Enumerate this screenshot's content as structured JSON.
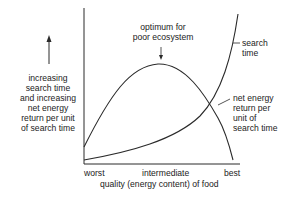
{
  "diagram": {
    "y_axis_label": [
      "increasing",
      "search time",
      "and increasing",
      "net energy",
      "return per unit",
      "of search time"
    ],
    "x_axis_label": "quality (energy content) of food",
    "x_ticks": [
      "worst",
      "intermediate",
      "best"
    ],
    "annotation": [
      "optimum for",
      "poor ecosystem"
    ],
    "curves": [
      {
        "name": "search time",
        "label": [
          "search",
          "time"
        ]
      },
      {
        "name": "net energy return per unit of search time",
        "label": [
          "net energy",
          "return per",
          "unit of",
          "search time"
        ]
      }
    ],
    "colors": {
      "line": "#2a2a2a",
      "text": "#222222",
      "background": "#ffffff"
    }
  }
}
